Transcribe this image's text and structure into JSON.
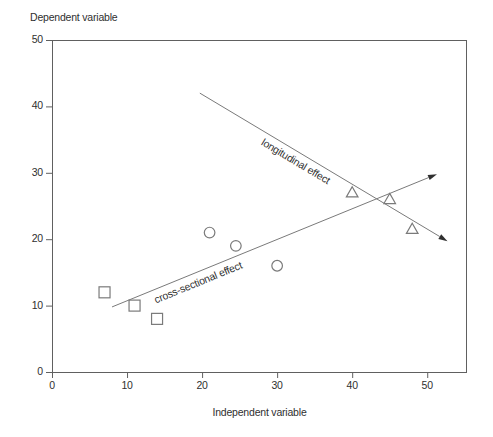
{
  "chart_data": {
    "type": "scatter",
    "title": "",
    "xlabel": "Independent variable",
    "ylabel": "Dependent variable",
    "xlim": [
      0,
      55.3
    ],
    "ylim": [
      0,
      50
    ],
    "x_ticks": [
      0,
      10,
      20,
      30,
      40,
      50
    ],
    "y_ticks": [
      0,
      10,
      20,
      30,
      40,
      50
    ],
    "grid": false,
    "legend": "none",
    "box": true,
    "series": [
      {
        "name": "square-group",
        "marker": "square",
        "points": [
          [
            7,
            12
          ],
          [
            11,
            10
          ],
          [
            14,
            8
          ]
        ]
      },
      {
        "name": "circle-group",
        "marker": "circle",
        "points": [
          [
            21,
            21
          ],
          [
            24.5,
            19
          ],
          [
            30,
            16
          ]
        ]
      },
      {
        "name": "triangle-group",
        "marker": "triangle",
        "points": [
          [
            40,
            27
          ],
          [
            45,
            26
          ],
          [
            48,
            21.5
          ]
        ]
      }
    ],
    "annotation_lines": [
      {
        "label": "longitudinal effect",
        "slug": "longitudinal-effect",
        "from": [
          19.7,
          42
        ],
        "to": [
          52.7,
          19.7
        ],
        "arrow": "end",
        "label_at": [
          32.5,
          31.8
        ]
      },
      {
        "label": "cross-sectional effect",
        "slug": "cross-sectional-effect",
        "from": [
          8,
          9.8
        ],
        "to": [
          51.3,
          29.8
        ],
        "arrow": "end",
        "label_at": [
          19.5,
          13.6
        ]
      }
    ],
    "colors": {
      "background": "#ffffff",
      "axis": "#606060",
      "trend_line": "#7a7a7a",
      "marker_stroke": "#7a7a7a",
      "arrow_fill": "#2f2f2f",
      "text": "#2f2f2f"
    }
  }
}
